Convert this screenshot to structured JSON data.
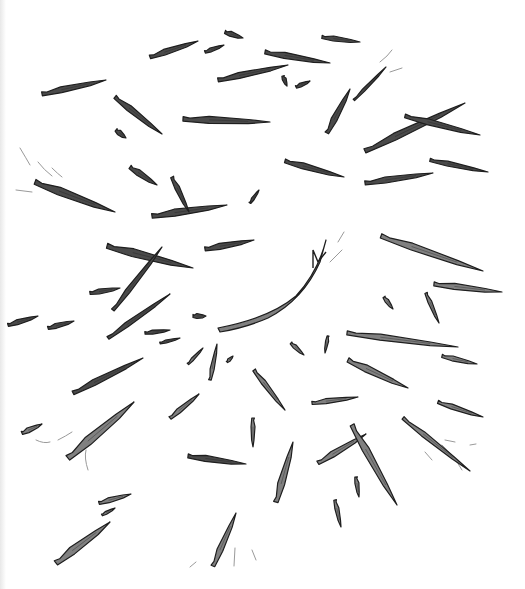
{
  "illustration": {
    "description": "Hand-drawn illustration of wooden splinters scattered outward from a central point",
    "background": "#ffffff",
    "shard_fill_dark": "#4a4a4a",
    "shard_fill_light": "#808080",
    "outline": "#1e1e1e",
    "shards": [
      {
        "x1": 42,
        "y1": 94,
        "x2": 106,
        "y2": 80,
        "w": 6,
        "tone": "dark"
      },
      {
        "x1": 150,
        "y1": 57,
        "x2": 198,
        "y2": 41,
        "w": 6,
        "tone": "dark"
      },
      {
        "x1": 205,
        "y1": 52,
        "x2": 224,
        "y2": 45,
        "w": 4,
        "tone": "dark"
      },
      {
        "x1": 225,
        "y1": 32,
        "x2": 243,
        "y2": 38,
        "w": 5,
        "tone": "dark"
      },
      {
        "x1": 218,
        "y1": 80,
        "x2": 288,
        "y2": 65,
        "w": 6,
        "tone": "dark"
      },
      {
        "x1": 265,
        "y1": 52,
        "x2": 330,
        "y2": 63,
        "w": 6,
        "tone": "dark"
      },
      {
        "x1": 322,
        "y1": 37,
        "x2": 360,
        "y2": 42,
        "w": 5,
        "tone": "dark"
      },
      {
        "x1": 283,
        "y1": 76,
        "x2": 287,
        "y2": 86,
        "w": 4,
        "tone": "dark"
      },
      {
        "x1": 296,
        "y1": 87,
        "x2": 310,
        "y2": 81,
        "w": 4,
        "tone": "dark"
      },
      {
        "x1": 327,
        "y1": 133,
        "x2": 350,
        "y2": 89,
        "w": 6,
        "tone": "dark"
      },
      {
        "x1": 354,
        "y1": 100,
        "x2": 386,
        "y2": 67,
        "w": 3,
        "tone": "dark"
      },
      {
        "x1": 115,
        "y1": 97,
        "x2": 162,
        "y2": 134,
        "w": 6,
        "tone": "dark"
      },
      {
        "x1": 116,
        "y1": 130,
        "x2": 126,
        "y2": 138,
        "w": 5,
        "tone": "dark"
      },
      {
        "x1": 183,
        "y1": 119,
        "x2": 270,
        "y2": 122,
        "w": 7,
        "tone": "dark"
      },
      {
        "x1": 365,
        "y1": 151,
        "x2": 465,
        "y2": 103,
        "w": 7,
        "tone": "dark"
      },
      {
        "x1": 405,
        "y1": 116,
        "x2": 480,
        "y2": 135,
        "w": 6,
        "tone": "dark"
      },
      {
        "x1": 285,
        "y1": 161,
        "x2": 344,
        "y2": 177,
        "w": 6,
        "tone": "dark"
      },
      {
        "x1": 365,
        "y1": 183,
        "x2": 433,
        "y2": 173,
        "w": 6,
        "tone": "dark"
      },
      {
        "x1": 430,
        "y1": 160,
        "x2": 488,
        "y2": 172,
        "w": 5,
        "tone": "dark"
      },
      {
        "x1": 130,
        "y1": 167,
        "x2": 157,
        "y2": 185,
        "w": 6,
        "tone": "dark"
      },
      {
        "x1": 35,
        "y1": 182,
        "x2": 115,
        "y2": 212,
        "w": 8,
        "tone": "dark"
      },
      {
        "x1": 152,
        "y1": 216,
        "x2": 227,
        "y2": 205,
        "w": 7,
        "tone": "dark"
      },
      {
        "x1": 172,
        "y1": 177,
        "x2": 189,
        "y2": 212,
        "w": 5,
        "tone": "dark"
      },
      {
        "x1": 250,
        "y1": 203,
        "x2": 259,
        "y2": 190,
        "w": 3,
        "tone": "dark"
      },
      {
        "x1": 107,
        "y1": 246,
        "x2": 193,
        "y2": 268,
        "w": 8,
        "tone": "dark"
      },
      {
        "x1": 113,
        "y1": 310,
        "x2": 162,
        "y2": 247,
        "w": 5,
        "tone": "dark"
      },
      {
        "x1": 205,
        "y1": 249,
        "x2": 254,
        "y2": 240,
        "w": 6,
        "tone": "dark"
      },
      {
        "x1": 90,
        "y1": 293,
        "x2": 120,
        "y2": 288,
        "w": 5,
        "tone": "dark"
      },
      {
        "x1": 8,
        "y1": 325,
        "x2": 38,
        "y2": 316,
        "w": 5,
        "tone": "dark"
      },
      {
        "x1": 48,
        "y1": 328,
        "x2": 74,
        "y2": 321,
        "w": 5,
        "tone": "dark"
      },
      {
        "x1": 108,
        "y1": 338,
        "x2": 170,
        "y2": 294,
        "w": 5,
        "tone": "dark"
      },
      {
        "x1": 145,
        "y1": 333,
        "x2": 170,
        "y2": 330,
        "w": 4,
        "tone": "dark"
      },
      {
        "x1": 160,
        "y1": 343,
        "x2": 180,
        "y2": 338,
        "w": 3,
        "tone": "dark"
      },
      {
        "x1": 193,
        "y1": 316,
        "x2": 206,
        "y2": 316,
        "w": 5,
        "tone": "dark"
      },
      {
        "x1": 381,
        "y1": 236,
        "x2": 483,
        "y2": 271,
        "w": 7,
        "tone": "light"
      },
      {
        "x1": 434,
        "y1": 284,
        "x2": 502,
        "y2": 292,
        "w": 6,
        "tone": "light"
      },
      {
        "x1": 384,
        "y1": 297,
        "x2": 393,
        "y2": 309,
        "w": 4,
        "tone": "light"
      },
      {
        "x1": 426,
        "y1": 293,
        "x2": 439,
        "y2": 323,
        "w": 4,
        "tone": "light"
      },
      {
        "x1": 347,
        "y1": 333,
        "x2": 458,
        "y2": 347,
        "w": 6,
        "tone": "light"
      },
      {
        "x1": 442,
        "y1": 356,
        "x2": 477,
        "y2": 364,
        "w": 5,
        "tone": "light"
      },
      {
        "x1": 348,
        "y1": 360,
        "x2": 408,
        "y2": 388,
        "w": 7,
        "tone": "light"
      },
      {
        "x1": 291,
        "y1": 343,
        "x2": 304,
        "y2": 355,
        "w": 4,
        "tone": "light"
      },
      {
        "x1": 328,
        "y1": 336,
        "x2": 325,
        "y2": 353,
        "w": 3,
        "tone": "light"
      },
      {
        "x1": 188,
        "y1": 364,
        "x2": 203,
        "y2": 348,
        "w": 3,
        "tone": "light"
      },
      {
        "x1": 210,
        "y1": 380,
        "x2": 217,
        "y2": 344,
        "w": 4,
        "tone": "light"
      },
      {
        "x1": 227,
        "y1": 362,
        "x2": 233,
        "y2": 356,
        "w": 3,
        "tone": "light"
      },
      {
        "x1": 73,
        "y1": 393,
        "x2": 143,
        "y2": 358,
        "w": 6,
        "tone": "dark"
      },
      {
        "x1": 68,
        "y1": 458,
        "x2": 134,
        "y2": 402,
        "w": 9,
        "tone": "light"
      },
      {
        "x1": 22,
        "y1": 433,
        "x2": 42,
        "y2": 424,
        "w": 5,
        "tone": "light"
      },
      {
        "x1": 170,
        "y1": 418,
        "x2": 199,
        "y2": 394,
        "w": 5,
        "tone": "light"
      },
      {
        "x1": 254,
        "y1": 370,
        "x2": 285,
        "y2": 410,
        "w": 5,
        "tone": "light"
      },
      {
        "x1": 312,
        "y1": 403,
        "x2": 358,
        "y2": 397,
        "w": 5,
        "tone": "light"
      },
      {
        "x1": 438,
        "y1": 402,
        "x2": 483,
        "y2": 417,
        "w": 5,
        "tone": "light"
      },
      {
        "x1": 253,
        "y1": 418,
        "x2": 253,
        "y2": 447,
        "w": 4,
        "tone": "light"
      },
      {
        "x1": 188,
        "y1": 456,
        "x2": 246,
        "y2": 464,
        "w": 6,
        "tone": "dark"
      },
      {
        "x1": 403,
        "y1": 418,
        "x2": 470,
        "y2": 471,
        "w": 5,
        "tone": "light"
      },
      {
        "x1": 318,
        "y1": 463,
        "x2": 366,
        "y2": 434,
        "w": 6,
        "tone": "light"
      },
      {
        "x1": 352,
        "y1": 425,
        "x2": 397,
        "y2": 505,
        "w": 7,
        "tone": "light"
      },
      {
        "x1": 276,
        "y1": 502,
        "x2": 293,
        "y2": 442,
        "w": 7,
        "tone": "light"
      },
      {
        "x1": 356,
        "y1": 477,
        "x2": 359,
        "y2": 497,
        "w": 4,
        "tone": "light"
      },
      {
        "x1": 335,
        "y1": 500,
        "x2": 341,
        "y2": 527,
        "w": 4,
        "tone": "light"
      },
      {
        "x1": 99,
        "y1": 503,
        "x2": 131,
        "y2": 494,
        "w": 5,
        "tone": "light"
      },
      {
        "x1": 102,
        "y1": 515,
        "x2": 115,
        "y2": 508,
        "w": 3,
        "tone": "light"
      },
      {
        "x1": 56,
        "y1": 563,
        "x2": 110,
        "y2": 522,
        "w": 8,
        "tone": "light"
      },
      {
        "x1": 213,
        "y1": 566,
        "x2": 236,
        "y2": 513,
        "w": 6,
        "tone": "light"
      }
    ],
    "curved_shard": {
      "path": "M 218 328 Q 270 318 296 296 Q 318 272 326 240 L 320 262 Q 303 300 268 318 Q 245 328 220 332 Z",
      "tone": "light"
    },
    "speed_lines": [
      "M 20 148 Q 26 158 30 165",
      "M 38 162 Q 44 170 52 176",
      "M 52 168 Q 58 174 62 177",
      "M 16 190 L 32 192",
      "M 380 62 Q 388 56 392 50",
      "M 390 72 L 402 68",
      "M 338 242 L 344 232",
      "M 330 262 Q 336 256 342 250",
      "M 36 440 Q 44 444 50 442",
      "M 58 440 Q 66 436 72 432",
      "M 86 450 Q 84 458 88 470",
      "M 442 445 Q 454 456 462 470",
      "M 425 452 L 432 460",
      "M 445 440 L 455 442",
      "M 470 445 L 476 444",
      "M 190 567 L 196 562",
      "M 252 550 L 256 560",
      "M 235 548 L 234 566"
    ]
  }
}
